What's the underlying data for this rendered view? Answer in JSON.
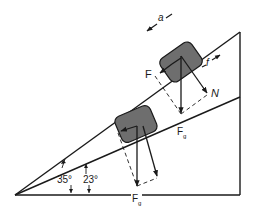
{
  "diagram": {
    "type": "free-body diagram on two inclines",
    "colors": {
      "line": "#1a1a1a",
      "block_fill": "#6e6e6e",
      "background": "#ffffff"
    },
    "inclines": [
      {
        "id": "steep",
        "angle_label": "35°"
      },
      {
        "id": "shallow",
        "angle_label": "23°"
      }
    ],
    "labels": {
      "acceleration": "a",
      "applied_force": "F",
      "friction": "f",
      "normal": "N",
      "gravity_upper": "F",
      "gravity_upper_sub": "g",
      "gravity_lower": "F",
      "gravity_lower_sub": "g",
      "angle_35": "35°",
      "angle_23": "23°"
    }
  }
}
